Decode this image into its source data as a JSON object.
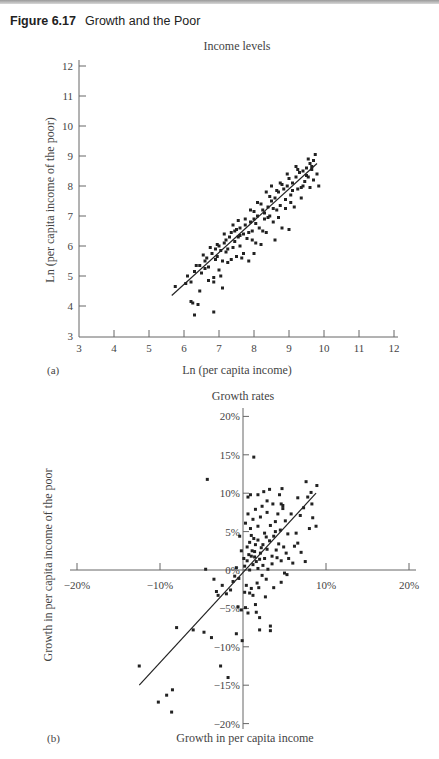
{
  "figure": {
    "number": "Figure 6.17",
    "title": "Growth and the Poor"
  },
  "chart_data": [
    {
      "type": "scatter",
      "panel": "(a)",
      "title": "Income levels",
      "xlabel": "Ln (per capita income)",
      "ylabel": "Ln (per capita income of the poor)",
      "xlim": [
        3,
        12
      ],
      "ylim": [
        3,
        12
      ],
      "xticks": [
        "3",
        "4",
        "5",
        "6",
        "7",
        "8",
        "9",
        "10",
        "11",
        "12"
      ],
      "yticks": [
        "3",
        "4",
        "5",
        "6",
        "7",
        "8",
        "9",
        "10",
        "11",
        "12"
      ],
      "grid": false,
      "legend": null,
      "regression_line": {
        "x": [
          5.65,
          9.8
        ],
        "y": [
          4.35,
          8.75
        ]
      },
      "points": [
        [
          5.75,
          4.65
        ],
        [
          6.05,
          4.75
        ],
        [
          6.1,
          5.0
        ],
        [
          6.2,
          4.8
        ],
        [
          6.2,
          4.15
        ],
        [
          6.25,
          4.1
        ],
        [
          6.3,
          3.7
        ],
        [
          6.4,
          4.05
        ],
        [
          6.45,
          4.5
        ],
        [
          6.3,
          5.15
        ],
        [
          6.35,
          5.35
        ],
        [
          6.45,
          5.35
        ],
        [
          6.5,
          5.1
        ],
        [
          6.6,
          5.5
        ],
        [
          6.65,
          5.6
        ],
        [
          6.7,
          5.3
        ],
        [
          6.7,
          4.85
        ],
        [
          6.8,
          5.75
        ],
        [
          6.85,
          4.95
        ],
        [
          6.85,
          4.8
        ],
        [
          6.85,
          3.8
        ],
        [
          6.9,
          5.9
        ],
        [
          6.95,
          5.65
        ],
        [
          7.0,
          6.0
        ],
        [
          7.0,
          5.2
        ],
        [
          7.05,
          5.0
        ],
        [
          7.1,
          4.6
        ],
        [
          7.1,
          5.5
        ],
        [
          7.15,
          6.1
        ],
        [
          7.2,
          5.8
        ],
        [
          7.25,
          5.45
        ],
        [
          7.3,
          6.3
        ],
        [
          7.35,
          6.45
        ],
        [
          7.4,
          5.95
        ],
        [
          7.45,
          6.15
        ],
        [
          7.5,
          6.55
        ],
        [
          7.5,
          5.65
        ],
        [
          7.55,
          6.3
        ],
        [
          7.6,
          6.6
        ],
        [
          7.65,
          5.6
        ],
        [
          7.7,
          6.4
        ],
        [
          7.7,
          5.75
        ],
        [
          7.75,
          6.7
        ],
        [
          7.8,
          6.25
        ],
        [
          7.85,
          5.5
        ],
        [
          7.9,
          6.8
        ],
        [
          7.95,
          6.5
        ],
        [
          8.0,
          6.9
        ],
        [
          8.0,
          5.75
        ],
        [
          8.05,
          6.1
        ],
        [
          8.1,
          7.0
        ],
        [
          8.15,
          6.6
        ],
        [
          8.2,
          6.05
        ],
        [
          8.25,
          7.2
        ],
        [
          8.3,
          6.9
        ],
        [
          8.35,
          6.45
        ],
        [
          8.4,
          7.3
        ],
        [
          8.45,
          7.0
        ],
        [
          8.5,
          7.5
        ],
        [
          8.55,
          6.8
        ],
        [
          8.6,
          7.6
        ],
        [
          8.6,
          6.2
        ],
        [
          8.65,
          7.2
        ],
        [
          8.7,
          7.8
        ],
        [
          8.75,
          7.35
        ],
        [
          8.8,
          6.6
        ],
        [
          8.85,
          7.9
        ],
        [
          8.9,
          7.55
        ],
        [
          8.95,
          8.0
        ],
        [
          9.0,
          6.55
        ],
        [
          9.05,
          7.7
        ],
        [
          9.1,
          8.1
        ],
        [
          9.15,
          7.3
        ],
        [
          9.2,
          8.3
        ],
        [
          9.25,
          7.9
        ],
        [
          9.3,
          8.45
        ],
        [
          9.35,
          7.6
        ],
        [
          9.4,
          8.5
        ],
        [
          9.45,
          8.15
        ],
        [
          9.5,
          8.6
        ],
        [
          9.55,
          8.3
        ],
        [
          9.6,
          8.75
        ],
        [
          9.6,
          7.95
        ],
        [
          9.65,
          8.55
        ],
        [
          9.7,
          8.85
        ],
        [
          9.7,
          8.2
        ],
        [
          9.75,
          9.05
        ],
        [
          9.8,
          8.4
        ],
        [
          9.85,
          8.0
        ],
        [
          9.55,
          8.9
        ],
        [
          6.55,
          5.7
        ],
        [
          6.75,
          5.95
        ],
        [
          6.95,
          6.05
        ],
        [
          7.05,
          5.85
        ],
        [
          7.2,
          6.2
        ],
        [
          7.35,
          5.55
        ],
        [
          7.45,
          6.5
        ],
        [
          7.6,
          6.0
        ],
        [
          7.75,
          6.9
        ],
        [
          7.85,
          6.45
        ],
        [
          8.0,
          7.15
        ],
        [
          8.05,
          6.75
        ],
        [
          8.2,
          7.4
        ],
        [
          8.3,
          7.1
        ],
        [
          8.45,
          7.65
        ],
        [
          8.55,
          7.25
        ],
        [
          8.65,
          7.85
        ],
        [
          8.8,
          8.05
        ],
        [
          8.9,
          7.25
        ],
        [
          9.0,
          8.25
        ],
        [
          9.1,
          7.85
        ],
        [
          9.25,
          8.55
        ],
        [
          9.4,
          8.0
        ],
        [
          9.5,
          8.35
        ],
        [
          9.65,
          8.65
        ],
        [
          7.15,
          6.4
        ],
        [
          7.4,
          6.7
        ],
        [
          7.55,
          6.85
        ],
        [
          7.9,
          7.2
        ],
        [
          8.1,
          7.45
        ],
        [
          8.35,
          7.8
        ],
        [
          8.5,
          8.0
        ],
        [
          8.75,
          8.1
        ],
        [
          8.95,
          8.4
        ],
        [
          9.2,
          8.65
        ],
        [
          6.6,
          5.25
        ],
        [
          6.9,
          5.55
        ],
        [
          7.25,
          5.9
        ],
        [
          7.6,
          6.35
        ],
        [
          7.95,
          6.2
        ],
        [
          8.25,
          6.5
        ],
        [
          8.4,
          6.95
        ],
        [
          8.7,
          6.95
        ],
        [
          9.05,
          7.45
        ],
        [
          9.35,
          7.95
        ]
      ]
    },
    {
      "type": "scatter",
      "panel": "(b)",
      "title": "Growth rates",
      "xlabel": "Growth in per capita income",
      "ylabel": "Growth in per capita income of the poor",
      "xlim": [
        -20,
        20
      ],
      "ylim": [
        -20,
        20
      ],
      "xticks": [
        "-20%",
        "-10%",
        "10%",
        "20%"
      ],
      "yticks": [
        "20%",
        "15%",
        "10%",
        "5%",
        "0%",
        "-5%",
        "-10%",
        "-15%",
        "-20%"
      ],
      "grid": false,
      "legend": null,
      "regression_line": {
        "x": [
          -12.5,
          8.8
        ],
        "y": [
          -15,
          10
        ]
      },
      "points": [
        [
          -12.5,
          -12.5
        ],
        [
          -10.2,
          -17.2
        ],
        [
          -9.2,
          -16.3
        ],
        [
          -8.5,
          -15.6
        ],
        [
          -8.6,
          -18.5
        ],
        [
          -8.0,
          -7.5
        ],
        [
          -6.0,
          -7.8
        ],
        [
          -4.7,
          -8.1
        ],
        [
          -3.8,
          -8.8
        ],
        [
          -2.7,
          -12.5
        ],
        [
          -1.8,
          -14.0
        ],
        [
          -0.8,
          -8.3
        ],
        [
          -0.1,
          -9.2
        ],
        [
          -4.3,
          11.8
        ],
        [
          -4.5,
          0.1
        ],
        [
          -3.5,
          -1.2
        ],
        [
          -3.2,
          -2.8
        ],
        [
          -3.0,
          -3.3
        ],
        [
          -2.5,
          -2.0
        ],
        [
          -2.0,
          -3.1
        ],
        [
          -1.5,
          -2.6
        ],
        [
          -1.2,
          -1.5
        ],
        [
          -1.0,
          -0.8
        ],
        [
          -0.8,
          0.3
        ],
        [
          -0.5,
          -1.1
        ],
        [
          -0.2,
          2.5
        ],
        [
          -0.4,
          4.4
        ],
        [
          -0.6,
          -4.8
        ],
        [
          -0.2,
          -5.2
        ],
        [
          0.3,
          -4.9
        ],
        [
          0.6,
          -5.6
        ],
        [
          0.8,
          -3.0
        ],
        [
          1.0,
          -2.4
        ],
        [
          1.2,
          -3.3
        ],
        [
          1.5,
          -4.5
        ],
        [
          1.6,
          -5.5
        ],
        [
          2.0,
          -6.2
        ],
        [
          2.0,
          -7.8
        ],
        [
          3.3,
          -7.3
        ],
        [
          3.3,
          -7.9
        ],
        [
          0.2,
          0.5
        ],
        [
          0.5,
          1.2
        ],
        [
          0.8,
          0.0
        ],
        [
          1.0,
          1.8
        ],
        [
          1.2,
          0.7
        ],
        [
          1.4,
          2.4
        ],
        [
          1.6,
          1.1
        ],
        [
          1.8,
          0.2
        ],
        [
          2.0,
          1.4
        ],
        [
          2.2,
          2.9
        ],
        [
          0.5,
          3.0
        ],
        [
          0.8,
          3.6
        ],
        [
          1.1,
          2.5
        ],
        [
          1.3,
          4.1
        ],
        [
          1.5,
          3.3
        ],
        [
          1.8,
          3.9
        ],
        [
          2.1,
          2.2
        ],
        [
          2.4,
          3.3
        ],
        [
          2.6,
          1.5
        ],
        [
          2.9,
          2.7
        ],
        [
          3.2,
          3.8
        ],
        [
          3.5,
          1.8
        ],
        [
          3.7,
          4.4
        ],
        [
          4.0,
          2.6
        ],
        [
          4.3,
          3.4
        ],
        [
          4.6,
          1.2
        ],
        [
          4.9,
          3.0
        ],
        [
          0.3,
          6.1
        ],
        [
          0.6,
          7.3
        ],
        [
          0.9,
          5.4
        ],
        [
          1.2,
          6.6
        ],
        [
          1.5,
          7.9
        ],
        [
          1.8,
          5.7
        ],
        [
          2.1,
          6.9
        ],
        [
          2.3,
          8.3
        ],
        [
          2.6,
          4.8
        ],
        [
          2.9,
          7.5
        ],
        [
          3.3,
          5.8
        ],
        [
          3.6,
          8.6
        ],
        [
          3.9,
          6.3
        ],
        [
          4.2,
          7.3
        ],
        [
          4.5,
          5.2
        ],
        [
          4.8,
          8.0
        ],
        [
          5.1,
          6.4
        ],
        [
          5.4,
          4.7
        ],
        [
          0.6,
          9.5
        ],
        [
          0.9,
          9.8
        ],
        [
          1.8,
          9.8
        ],
        [
          2.5,
          10.2
        ],
        [
          3.2,
          10.5
        ],
        [
          4.4,
          9.8
        ],
        [
          4.7,
          10.6
        ],
        [
          1.3,
          14.7
        ],
        [
          2.9,
          9.0
        ],
        [
          4.6,
          8.6
        ],
        [
          4.8,
          8.4
        ],
        [
          6.4,
          4.8
        ],
        [
          6.6,
          3.5
        ],
        [
          7.0,
          2.3
        ],
        [
          7.5,
          1.1
        ],
        [
          8.0,
          5.4
        ],
        [
          8.4,
          6.8
        ],
        [
          8.8,
          5.7
        ],
        [
          7.6,
          11.5
        ],
        [
          7.8,
          9.5
        ],
        [
          8.2,
          10.1
        ],
        [
          8.9,
          11.0
        ],
        [
          8.3,
          8.6
        ],
        [
          6.9,
          7.1
        ],
        [
          5.5,
          1.5
        ],
        [
          5.3,
          -0.6
        ],
        [
          4.6,
          -1.6
        ],
        [
          3.7,
          -2.3
        ],
        [
          2.8,
          -1.2
        ],
        [
          5.0,
          -0.4
        ],
        [
          6.0,
          0.9
        ],
        [
          3.0,
          0.1
        ],
        [
          2.3,
          -0.7
        ],
        [
          1.7,
          -1.7
        ],
        [
          0.2,
          -2.9
        ],
        [
          0.4,
          -2.0
        ],
        [
          1.9,
          -2.3
        ],
        [
          2.7,
          -3.5
        ],
        [
          0.1,
          1.5
        ],
        [
          0.7,
          2.0
        ],
        [
          1.4,
          1.7
        ],
        [
          2.4,
          0.6
        ],
        [
          3.5,
          0.8
        ],
        [
          4.1,
          1.6
        ],
        [
          5.2,
          2.2
        ],
        [
          6.2,
          3.1
        ],
        [
          5.8,
          7.3
        ],
        [
          7.3,
          8.1
        ],
        [
          6.6,
          9.4
        ],
        [
          1.0,
          4.5
        ],
        [
          2.8,
          4.3
        ],
        [
          3.9,
          5.0
        ]
      ]
    }
  ]
}
